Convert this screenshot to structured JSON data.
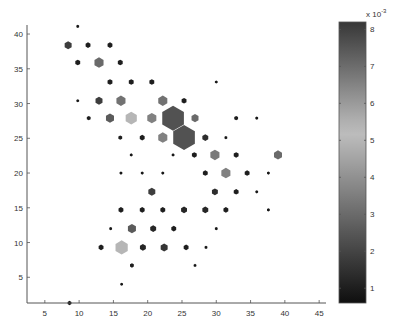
{
  "chart_data": {
    "type": "scatter",
    "subtype": "hexbin",
    "title": "",
    "xlabel": "",
    "ylabel": "",
    "xlim": [
      2.4,
      46
    ],
    "ylim": [
      1.3,
      41.3
    ],
    "xticks": [
      5,
      10,
      15,
      20,
      25,
      30,
      35,
      40,
      45
    ],
    "yticks": [
      5,
      10,
      15,
      20,
      25,
      30,
      35,
      40
    ],
    "xtick_labels": [
      "5",
      "10",
      "15",
      "20",
      "25",
      "30",
      "35",
      "40",
      "45"
    ],
    "ytick_labels": [
      "5",
      "10",
      "15",
      "20",
      "25",
      "30",
      "35",
      "40"
    ],
    "grid": false,
    "colorbar": {
      "label": "x 10",
      "exponent": "-3",
      "range": [
        0.6,
        8.2
      ],
      "ticks": [
        1,
        2,
        3,
        4,
        5,
        6,
        7,
        8
      ],
      "tick_labels": [
        "1",
        "2",
        "3",
        "4",
        "5",
        "6",
        "7",
        "8"
      ],
      "colormap": "gray-dark-light-dark",
      "placement": "right"
    },
    "size_note": "relative hexagon size (1 = smallest, 10 = largest)",
    "points": [
      {
        "x": 9.8,
        "y": 41.1,
        "size": 1,
        "value": 0.8
      },
      {
        "x": 8.4,
        "y": 38.4,
        "size": 3,
        "value": 1.8
      },
      {
        "x": 11.3,
        "y": 38.4,
        "size": 2,
        "value": 1.0
      },
      {
        "x": 14.5,
        "y": 38.4,
        "size": 2,
        "value": 1.0
      },
      {
        "x": 9.8,
        "y": 35.9,
        "size": 2,
        "value": 1.0
      },
      {
        "x": 12.9,
        "y": 35.9,
        "size": 4,
        "value": 3.0
      },
      {
        "x": 16.0,
        "y": 35.9,
        "size": 2,
        "value": 1.0
      },
      {
        "x": 14.5,
        "y": 33.1,
        "size": 2,
        "value": 1.0
      },
      {
        "x": 17.6,
        "y": 33.1,
        "size": 2,
        "value": 1.0
      },
      {
        "x": 20.6,
        "y": 33.1,
        "size": 2,
        "value": 1.0
      },
      {
        "x": 9.8,
        "y": 30.4,
        "size": 1,
        "value": 0.8
      },
      {
        "x": 12.9,
        "y": 30.4,
        "size": 3,
        "value": 1.8
      },
      {
        "x": 16.1,
        "y": 30.4,
        "size": 4,
        "value": 3.2
      },
      {
        "x": 22.2,
        "y": 30.4,
        "size": 4,
        "value": 3.2
      },
      {
        "x": 25.3,
        "y": 30.4,
        "size": 2,
        "value": 1.0
      },
      {
        "x": 30.0,
        "y": 33.1,
        "size": 1,
        "value": 0.8
      },
      {
        "x": 11.4,
        "y": 27.9,
        "size": 1.5,
        "value": 1.0
      },
      {
        "x": 14.5,
        "y": 27.9,
        "size": 3.5,
        "value": 2.6
      },
      {
        "x": 17.6,
        "y": 27.9,
        "size": 5,
        "value": 5.0
      },
      {
        "x": 20.6,
        "y": 27.9,
        "size": 4,
        "value": 3.6
      },
      {
        "x": 23.7,
        "y": 27.9,
        "size": 10,
        "value": 7.6
      },
      {
        "x": 26.9,
        "y": 27.9,
        "size": 3,
        "value": 3.0
      },
      {
        "x": 32.9,
        "y": 27.9,
        "size": 1.5,
        "value": 1.0
      },
      {
        "x": 35.9,
        "y": 27.9,
        "size": 1,
        "value": 0.8
      },
      {
        "x": 16.0,
        "y": 25.1,
        "size": 1.5,
        "value": 1.0
      },
      {
        "x": 19.2,
        "y": 25.1,
        "size": 2,
        "value": 1.0
      },
      {
        "x": 22.2,
        "y": 25.1,
        "size": 4,
        "value": 3.6
      },
      {
        "x": 25.3,
        "y": 25.1,
        "size": 10,
        "value": 7.6
      },
      {
        "x": 28.4,
        "y": 25.1,
        "size": 2.5,
        "value": 1.4
      },
      {
        "x": 31.4,
        "y": 25.1,
        "size": 1,
        "value": 0.8
      },
      {
        "x": 17.6,
        "y": 22.6,
        "size": 1,
        "value": 0.8
      },
      {
        "x": 23.7,
        "y": 22.6,
        "size": 1,
        "value": 0.8
      },
      {
        "x": 26.8,
        "y": 22.6,
        "size": 2,
        "value": 1.0
      },
      {
        "x": 29.8,
        "y": 22.6,
        "size": 4,
        "value": 3.4
      },
      {
        "x": 32.9,
        "y": 22.6,
        "size": 2,
        "value": 1.0
      },
      {
        "x": 39.0,
        "y": 22.6,
        "size": 3.5,
        "value": 3.0
      },
      {
        "x": 16.1,
        "y": 20.0,
        "size": 1,
        "value": 0.8
      },
      {
        "x": 19.2,
        "y": 20.0,
        "size": 1,
        "value": 0.8
      },
      {
        "x": 22.2,
        "y": 20.0,
        "size": 1,
        "value": 0.8
      },
      {
        "x": 28.4,
        "y": 20.0,
        "size": 2,
        "value": 1.0
      },
      {
        "x": 31.4,
        "y": 20.0,
        "size": 4,
        "value": 3.6
      },
      {
        "x": 34.5,
        "y": 20.0,
        "size": 2,
        "value": 1.0
      },
      {
        "x": 37.6,
        "y": 20.0,
        "size": 1,
        "value": 0.8
      },
      {
        "x": 20.6,
        "y": 17.3,
        "size": 3,
        "value": 1.8
      },
      {
        "x": 29.8,
        "y": 17.3,
        "size": 2.5,
        "value": 1.4
      },
      {
        "x": 32.9,
        "y": 17.3,
        "size": 2,
        "value": 1.0
      },
      {
        "x": 35.9,
        "y": 17.3,
        "size": 1,
        "value": 0.8
      },
      {
        "x": 16.1,
        "y": 14.7,
        "size": 2,
        "value": 1.0
      },
      {
        "x": 19.2,
        "y": 14.7,
        "size": 2,
        "value": 1.0
      },
      {
        "x": 22.2,
        "y": 14.7,
        "size": 2,
        "value": 1.0
      },
      {
        "x": 25.3,
        "y": 14.7,
        "size": 2.5,
        "value": 1.2
      },
      {
        "x": 28.4,
        "y": 14.7,
        "size": 2.5,
        "value": 1.2
      },
      {
        "x": 31.4,
        "y": 14.7,
        "size": 2,
        "value": 1.0
      },
      {
        "x": 37.6,
        "y": 14.7,
        "size": 1,
        "value": 0.8
      },
      {
        "x": 14.6,
        "y": 12.0,
        "size": 1,
        "value": 0.8
      },
      {
        "x": 17.7,
        "y": 12.0,
        "size": 3.5,
        "value": 2.6
      },
      {
        "x": 20.8,
        "y": 12.0,
        "size": 2.5,
        "value": 1.2
      },
      {
        "x": 23.8,
        "y": 12.0,
        "size": 2,
        "value": 1.0
      },
      {
        "x": 30.0,
        "y": 12.0,
        "size": 1,
        "value": 0.8
      },
      {
        "x": 13.2,
        "y": 9.3,
        "size": 2,
        "value": 1.0
      },
      {
        "x": 16.2,
        "y": 9.3,
        "size": 5.5,
        "value": 5.0
      },
      {
        "x": 19.3,
        "y": 9.3,
        "size": 2.5,
        "value": 1.2
      },
      {
        "x": 22.4,
        "y": 9.3,
        "size": 3,
        "value": 1.6
      },
      {
        "x": 25.6,
        "y": 9.3,
        "size": 2,
        "value": 1.0
      },
      {
        "x": 28.5,
        "y": 9.3,
        "size": 1,
        "value": 0.8
      },
      {
        "x": 17.7,
        "y": 6.7,
        "size": 1.5,
        "value": 1.0
      },
      {
        "x": 26.9,
        "y": 6.7,
        "size": 1,
        "value": 0.8
      },
      {
        "x": 16.2,
        "y": 4.0,
        "size": 1,
        "value": 0.8
      },
      {
        "x": 8.6,
        "y": 1.3,
        "size": 1.5,
        "value": 0.8
      }
    ]
  }
}
